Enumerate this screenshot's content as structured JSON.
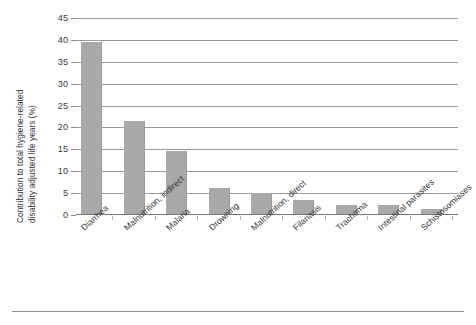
{
  "chart_data": {
    "type": "bar",
    "title": "",
    "subtitle": "",
    "xlabel": "",
    "ylabel": "Contribution to total hygiene-related disability adjusted life years (%)",
    "ylabel_lines": [
      "Contribution to total hygiene-related",
      "disability adjusted life years (%)"
    ],
    "categories": [
      "Diarrhea",
      "Malnutrition, indirect",
      "Malaria",
      "Drowning",
      "Malnutrition, direct",
      "Filariasis",
      "Trachoma",
      "Intestinal parasites",
      "Schistosomiases"
    ],
    "values": [
      39.4,
      21.3,
      14.3,
      6.0,
      4.8,
      3.2,
      2.1,
      2.0,
      1.1
    ],
    "ylim": [
      0,
      45
    ],
    "yticks": [
      0,
      5,
      10,
      15,
      20,
      25,
      30,
      35,
      40,
      45
    ],
    "ytick_labels": [
      "0",
      "5",
      "10",
      "15",
      "20",
      "25",
      "30",
      "35",
      "40",
      "45"
    ],
    "grid": true,
    "grid_axis": "y",
    "legend": false,
    "legend_position": "none",
    "bar_color": "#a9a9a9",
    "grid_color": "#9a9a9a",
    "axis_color": "#777777",
    "text_color": "#2e2e2e",
    "background_color": "#ffffff",
    "annotations": []
  }
}
